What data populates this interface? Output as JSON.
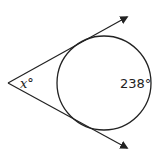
{
  "diagram": {
    "type": "circle with two tangents from external point",
    "angle_label": "x°",
    "arc_label": "238°",
    "colors": {
      "stroke": "#222222",
      "background": "#ffffff"
    }
  }
}
